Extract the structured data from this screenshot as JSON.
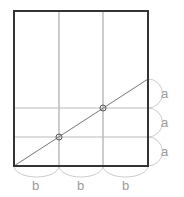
{
  "diagram": {
    "labels": {
      "a1": "a",
      "a2": "a",
      "a3": "a",
      "b1": "b",
      "b2": "b",
      "b3": "b"
    },
    "colors": {
      "frame": "#333333",
      "grid": "#999999",
      "arc": "#cccccc",
      "label": "#9a9a9a"
    }
  }
}
